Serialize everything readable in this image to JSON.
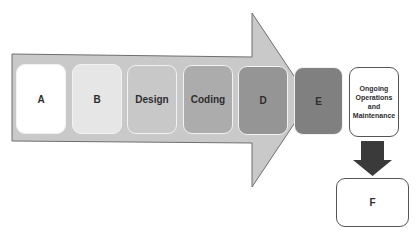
{
  "diagram": {
    "type": "process-flow",
    "stages": [
      {
        "id": "A",
        "label": "A",
        "fill": "#ffffff"
      },
      {
        "id": "B",
        "label": "B",
        "fill": "#e6e6e6"
      },
      {
        "id": "design",
        "label": "Design",
        "fill": "#c8c8c8"
      },
      {
        "id": "coding",
        "label": "Coding",
        "fill": "#acacac"
      },
      {
        "id": "D",
        "label": "D",
        "fill": "#959595"
      },
      {
        "id": "E",
        "label": "E",
        "fill": "#808080"
      }
    ],
    "ongoing": {
      "label": "Ongoing Operations and Maintenance",
      "lines": [
        "Ongoing",
        "Operations",
        "and",
        "Maintenance"
      ]
    },
    "final": {
      "label": "F"
    },
    "colors": {
      "arrow_fill": "#c9c9c9",
      "arrow_stroke": "#6e6e6e",
      "down_arrow": "#3a3a3a",
      "outline": "#555555"
    }
  }
}
